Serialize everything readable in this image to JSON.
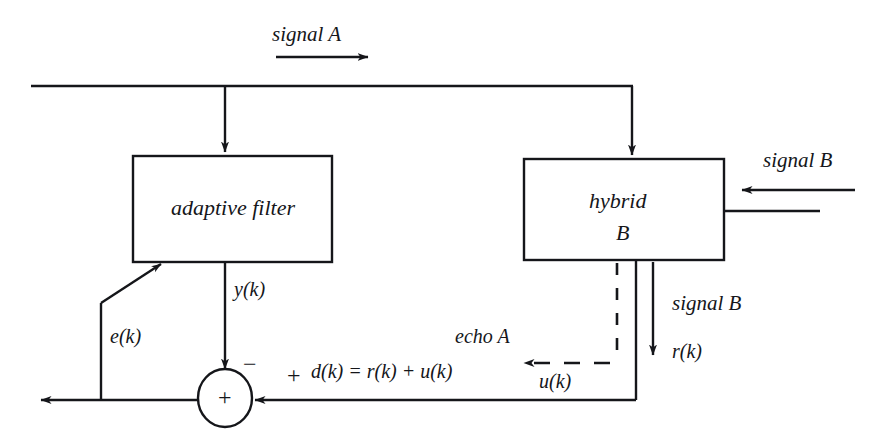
{
  "figure": {
    "kind": "block-diagram",
    "line_color": "#15161a",
    "background_color": "#ffffff"
  },
  "blocks": {
    "adaptive_filter": {
      "label": "adaptive filter"
    },
    "hybrid": {
      "label_line1": "hybrid",
      "label_line2": "B"
    }
  },
  "signals": {
    "signal_a": "signal A",
    "signal_b_top_right": "signal B",
    "signal_b_middle": "signal B",
    "echo_a": "echo A"
  },
  "variables": {
    "y": "y(k)",
    "e": "e(k)",
    "r": "r(k)",
    "u": "u(k)",
    "d_equation": "d(k) = r(k) + u(k)"
  },
  "signs": {
    "minus": "−",
    "plus_input": "+",
    "summer": "+"
  }
}
